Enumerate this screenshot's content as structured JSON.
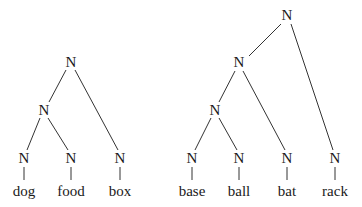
{
  "trees": [
    {
      "name": "dog-food-box",
      "nodes": [
        {
          "id": "l-root",
          "label": "N",
          "x": 71,
          "y": 62
        },
        {
          "id": "l-mid",
          "label": "N",
          "x": 44,
          "y": 110
        },
        {
          "id": "l-n1",
          "label": "N",
          "x": 24,
          "y": 158
        },
        {
          "id": "l-n2",
          "label": "N",
          "x": 71,
          "y": 158
        },
        {
          "id": "l-n3",
          "label": "N",
          "x": 120,
          "y": 158
        }
      ],
      "words": [
        {
          "label": "dog",
          "x": 24,
          "y": 191
        },
        {
          "label": "food",
          "x": 71,
          "y": 191
        },
        {
          "label": "box",
          "x": 120,
          "y": 191
        }
      ]
    },
    {
      "name": "base-ball-bat-rack",
      "nodes": [
        {
          "id": "r-root",
          "label": "N",
          "x": 287,
          "y": 15
        },
        {
          "id": "r-n2",
          "label": "N",
          "x": 239,
          "y": 62
        },
        {
          "id": "r-n3",
          "label": "N",
          "x": 215,
          "y": 110
        },
        {
          "id": "r-l1",
          "label": "N",
          "x": 192,
          "y": 158
        },
        {
          "id": "r-l2",
          "label": "N",
          "x": 239,
          "y": 158
        },
        {
          "id": "r-l3",
          "label": "N",
          "x": 287,
          "y": 158
        },
        {
          "id": "r-l4",
          "label": "N",
          "x": 335,
          "y": 158
        }
      ],
      "words": [
        {
          "label": "base",
          "x": 192,
          "y": 191
        },
        {
          "label": "ball",
          "x": 239,
          "y": 191
        },
        {
          "label": "bat",
          "x": 287,
          "y": 191
        },
        {
          "label": "rack",
          "x": 335,
          "y": 191
        }
      ]
    }
  ]
}
